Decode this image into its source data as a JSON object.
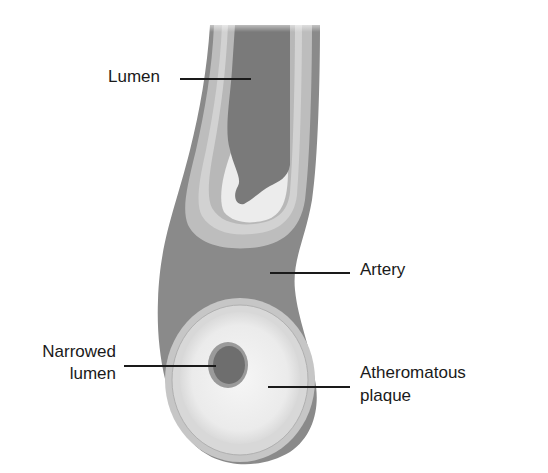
{
  "diagram": {
    "labels": {
      "lumen": "Lumen",
      "artery": "Artery",
      "narrowed_lumen_line1": "Narrowed",
      "narrowed_lumen_line2": "lumen",
      "plaque_line1": "Atheromatous",
      "plaque_line2": "plaque"
    },
    "colors": {
      "artery_wall": "#8a8a8a",
      "lumen": "#7a7a7a",
      "intima": "#c4c4c4",
      "plaque": "#ececec",
      "leader": "#1a1a1a"
    }
  }
}
